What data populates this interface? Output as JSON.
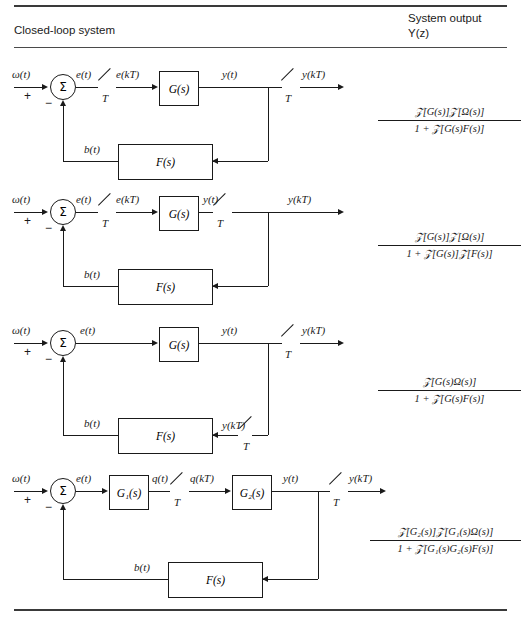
{
  "header": {
    "left_title": "Closed-loop system",
    "right_title_line1": "System output",
    "right_title_line2": "Y(z)"
  },
  "rows": [
    {
      "id": "row-1",
      "labels": {
        "input": "ω(t)",
        "plus": "+",
        "minus": "−",
        "sum_symbol": "Σ",
        "error": "e(t)",
        "sampler1_period": "T",
        "error_sampled": "e(kT)",
        "forward_block": "G(s)",
        "output_cont": "y(t)",
        "sampler2_period": "T",
        "output_sampled": "y(kT)",
        "feedback_signal": "b(t)",
        "feedback_block": "F(s)"
      },
      "formula": {
        "numerator": "𝒵[G(s)]𝒵[Ω(s)]",
        "denominator": "1 + 𝒵[G(s)F(s)]"
      }
    },
    {
      "id": "row-2",
      "labels": {
        "input": "ω(t)",
        "plus": "+",
        "minus": "−",
        "sum_symbol": "Σ",
        "error": "e(t)",
        "sampler1_period": "T",
        "error_sampled": "e(kT)",
        "forward_block": "G(s)",
        "output_cont": "y(t)",
        "sampler2_period": "T",
        "output_sampled": "y(kT)",
        "feedback_signal": "b(t)",
        "feedback_block": "F(s)"
      },
      "formula": {
        "numerator": "𝒵[G(s)]𝒵[Ω(s)]",
        "denominator": "1 + 𝒵[G(s)]𝒵[F(s)]"
      }
    },
    {
      "id": "row-3",
      "labels": {
        "input": "ω(t)",
        "plus": "+",
        "minus": "−",
        "sum_symbol": "Σ",
        "error": "e(t)",
        "forward_block": "G(s)",
        "output_cont": "y(t)",
        "sampler2_period": "T",
        "output_sampled": "y(kT)",
        "feedback_signal": "b(t)",
        "feedback_block": "F(s)",
        "feedback_sampled": "y(kT)",
        "feedback_sampler_period": "T"
      },
      "formula": {
        "numerator": "𝒵[G(s)Ω(s)]",
        "denominator": "1 + 𝒵[G(s)F(s)]"
      }
    },
    {
      "id": "row-4",
      "labels": {
        "input": "ω(t)",
        "plus": "+",
        "minus": "−",
        "sum_symbol": "Σ",
        "error": "e(t)",
        "block1": "G₁(s)",
        "mid_cont": "q(t)",
        "sampler1_period": "T",
        "mid_sampled": "q(kT)",
        "block2": "G₂(s)",
        "output_cont": "y(t)",
        "sampler2_period": "T",
        "output_sampled": "y(kT)",
        "feedback_signal": "b(t)",
        "feedback_block": "F(s)"
      },
      "formula": {
        "numerator": "𝒵[G₂(s)]𝒵[G₁(s)Ω(s)]",
        "denominator": "1 + 𝒵[G₁(s)G₂(s)F(s)]"
      }
    }
  ],
  "colors": {
    "ink": "#1a1a1a",
    "rule": "#3a3a3a",
    "background": "#ffffff"
  }
}
